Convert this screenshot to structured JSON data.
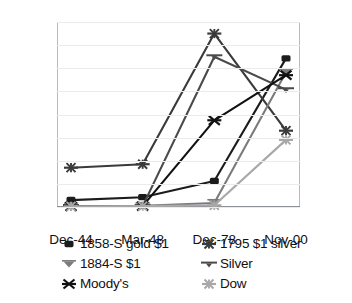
{
  "chart_data": {
    "type": "line",
    "title": "",
    "subtitle": "",
    "xlabel": "",
    "ylabel": "",
    "categories": [
      "Dec-44",
      "Mar-48",
      "Dec-78",
      "Nov-00"
    ],
    "grid": true,
    "legend_position": "bottom",
    "axes": {
      "left": {
        "min": 0,
        "max": 32000,
        "step": 4000,
        "ticks": [
          "0",
          "4000",
          "8000",
          "12000",
          "16000",
          "20000",
          "24000",
          "28000",
          "32000"
        ]
      },
      "right": {
        "min": 0,
        "max": 12,
        "step": 2,
        "ticks": [
          "0",
          "2",
          "4",
          "6",
          "8",
          "10",
          "12"
        ]
      }
    },
    "series": [
      {
        "name": "1858-S gold $1",
        "axis": "left",
        "color": "#1c1c1c",
        "marker": "square-filled",
        "values": [
          1200,
          1700,
          4500,
          25700
        ]
      },
      {
        "name": "1795 $1 silver",
        "axis": "left",
        "color": "#3a3a3a",
        "marker": "starburst",
        "values": [
          6800,
          7400,
          30000,
          13200
        ]
      },
      {
        "name": "1884-S $1",
        "axis": "left",
        "color": "#7b7b7b",
        "marker": "triangle-down",
        "values": [
          120,
          200,
          700,
          23300
        ]
      },
      {
        "name": "Silver",
        "axis": "left",
        "color": "#4a4a4a",
        "marker": "dash",
        "values": [
          100,
          150,
          26000,
          20300
        ]
      },
      {
        "name": "Moody's",
        "axis": "left",
        "color": "#111111",
        "marker": "x-cross",
        "values": [
          100,
          150,
          15000,
          22800
        ]
      },
      {
        "name": "Dow",
        "axis": "left",
        "color": "#a8a8a8",
        "marker": "asterisk",
        "values": [
          100,
          150,
          300,
          11600
        ]
      }
    ]
  },
  "legend": {
    "rows": [
      [
        {
          "label": "1858-S gold $1",
          "marker": "square-filled",
          "color": "#1c1c1c",
          "icon": "square-marker-icon"
        },
        {
          "label": "1795 $1 silver",
          "marker": "starburst",
          "color": "#3a3a3a",
          "icon": "starburst-marker-icon"
        }
      ],
      [
        {
          "label": "1884-S $1",
          "marker": "triangle-down",
          "color": "#7b7b7b",
          "icon": "triangle-down-marker-icon"
        },
        {
          "label": "Silver",
          "marker": "dash",
          "color": "#4a4a4a",
          "icon": "dash-marker-icon"
        }
      ],
      [
        {
          "label": "Moody's",
          "marker": "x-cross",
          "color": "#111111",
          "icon": "x-cross-marker-icon"
        },
        {
          "label": "Dow",
          "marker": "asterisk",
          "color": "#a8a8a8",
          "icon": "asterisk-marker-icon"
        }
      ]
    ]
  }
}
